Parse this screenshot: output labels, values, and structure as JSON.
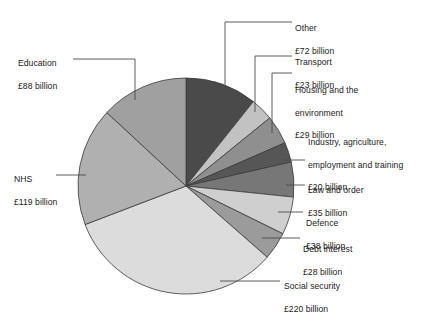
{
  "chart_data": {
    "type": "pie",
    "title": "",
    "subtitle": "",
    "xlabel": "",
    "ylabel": "",
    "currency": "£",
    "unit": "billion",
    "total": 672,
    "start_angle_deg": 0,
    "direction": "clockwise",
    "legend_position": "callout-labels",
    "grid": false,
    "categories": [
      "Other",
      "Transport",
      "Housing and the environment",
      "Industry, agriculture, employment and training",
      "Law and order",
      "Defence",
      "Debt interest",
      "Social security",
      "NHS",
      "Education"
    ],
    "values": [
      72,
      23,
      29,
      20,
      35,
      38,
      28,
      220,
      119,
      88
    ],
    "colors": [
      "#4a4a4a",
      "#c2c2c2",
      "#8f8f8f",
      "#565656",
      "#777777",
      "#cfcfcf",
      "#9b9b9b",
      "#dcdcdc",
      "#b0b0b0",
      "#a0a0a0"
    ]
  },
  "labels": {
    "other": {
      "name": "Other",
      "value": "£72 billion"
    },
    "transport": {
      "name": "Transport",
      "value": "£23 billion"
    },
    "housing": {
      "name_line1": "Housing and the",
      "name_line2": "environment",
      "value": "£29 billion"
    },
    "industry": {
      "name_line1": "Industry, agriculture,",
      "name_line2": "employment and training",
      "value": "£20 billion"
    },
    "law": {
      "name": "Law and order",
      "value": "£35 billion"
    },
    "defence": {
      "name": "Defence",
      "value": "£38 billion"
    },
    "debt": {
      "name": "Debt interest",
      "value": "£28 billion"
    },
    "social": {
      "name": "Social security",
      "value": "£220 billion"
    },
    "nhs": {
      "name": "NHS",
      "value": "£119 billion"
    },
    "education": {
      "name": "Education",
      "value": "£88 billion"
    }
  }
}
